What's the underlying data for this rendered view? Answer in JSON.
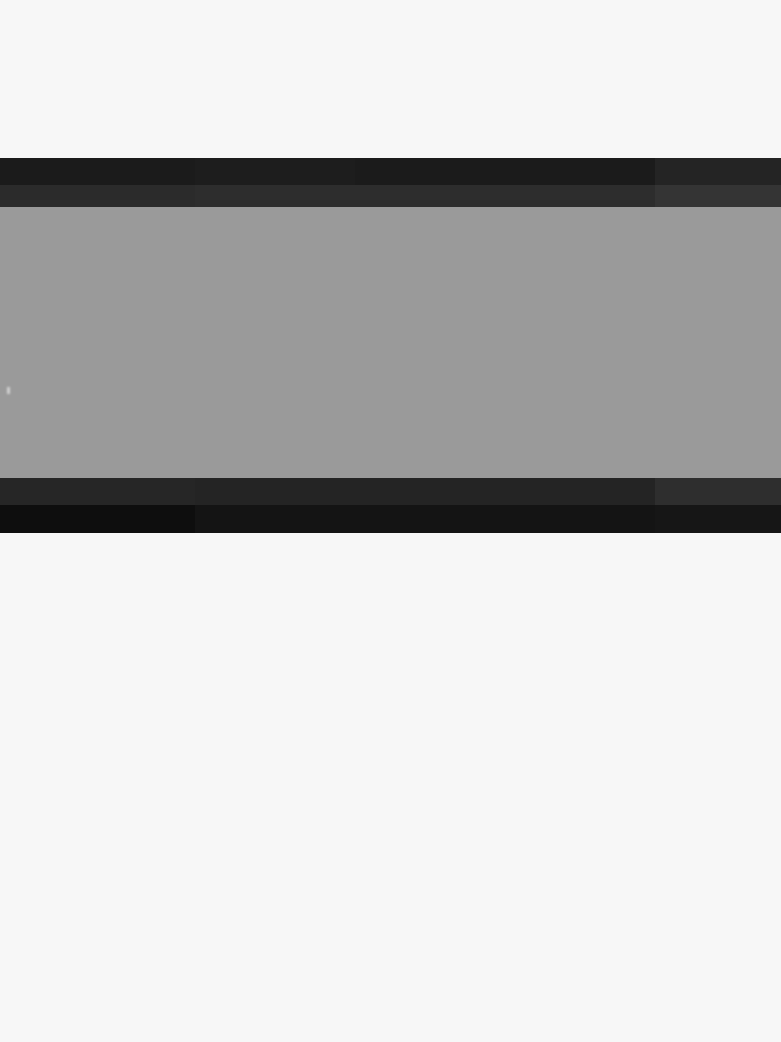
{
  "state": {
    "name": "blank",
    "description": "",
    "has_text": false,
    "has_icons": false
  },
  "page": {
    "background_color": "#f7f7f7",
    "width": 781,
    "height": 1042,
    "top_empty_label": "",
    "bottom_empty_label": ""
  },
  "window": {
    "title": "",
    "header": {
      "color": "#1b1b1b",
      "title": "",
      "segments": [
        {
          "label": "",
          "color": "#1b1b1b"
        },
        {
          "label": "",
          "color": "#1d1d1d"
        },
        {
          "label": "",
          "color": "#1b1b1b"
        },
        {
          "label": "",
          "color": "#242424"
        }
      ]
    },
    "toolbar": {
      "color": "#2b2b2b",
      "segments": [
        {
          "label": "",
          "color": "#2b2b2b"
        },
        {
          "label": "",
          "color": "#2d2d2d"
        },
        {
          "label": "",
          "color": "#343434"
        }
      ]
    },
    "content": {
      "color": "#9a9a9a",
      "body_text": "",
      "caret_visible": true
    },
    "footer_strip": {
      "color": "#262626",
      "segments": [
        {
          "label": "",
          "color": "#262626"
        },
        {
          "label": "",
          "color": "#242424"
        },
        {
          "label": "",
          "color": "#2e2e2e"
        }
      ]
    },
    "footer_bar": {
      "color": "#121212",
      "status_text": "",
      "segments": [
        {
          "label": "",
          "color": "#0e0e0e"
        },
        {
          "label": "",
          "color": "#141414"
        },
        {
          "label": "",
          "color": "#161616"
        }
      ]
    }
  }
}
